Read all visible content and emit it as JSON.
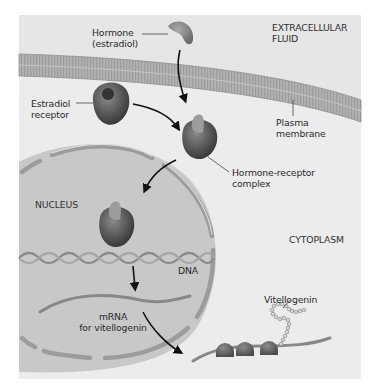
{
  "diagram": {
    "regions": {
      "extracellular": "EXTRACELLULAR\nFLUID",
      "nucleus": "NUCLEUS",
      "cytoplasm": "CYTOPLASM"
    },
    "labels": {
      "hormone": "Hormone\n(estradiol)",
      "receptor": "Estradiol\nreceptor",
      "plasma_membrane": "Plasma\nmembrane",
      "complex": "Hormone-receptor\ncomplex",
      "dna": "DNA",
      "mrna": "mRNA\nfor vitellogenin",
      "vitellogenin": "Vitellogenin"
    },
    "colors": {
      "panel_bg": "#ececec",
      "membrane": "#a9a9a9",
      "nucleus_fill": "#c6c6c6",
      "nuclear_envelope": "#9a9a9a",
      "protein": "#555555",
      "arrow": "#111111"
    }
  }
}
